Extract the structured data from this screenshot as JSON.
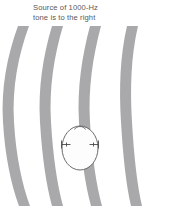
{
  "figure": {
    "caption_line1": "Source of 1000-Hz",
    "caption_line2": "tone is to the right",
    "caption": "Source of 1000-Hz\ntone is to the right",
    "caption_color": "#58585a",
    "background_color": "#ffffff"
  },
  "scene": {
    "sound_source_direction": "right",
    "tone_frequency": "1000-Hz",
    "view": "top-down head",
    "wavefronts": {
      "count": 4,
      "color": "#a9a9ab",
      "band_width": 10,
      "curvature": "concave toward the right",
      "top_x": [
        18,
        52,
        90,
        127
      ],
      "mid_x": [
        3,
        40,
        79,
        121
      ],
      "bottom_x": [
        19,
        52,
        91,
        128
      ]
    },
    "head": {
      "outline_color": "#5b5b5d",
      "fill_color": "#fdfdfd",
      "center_x": 80,
      "center_y": 122,
      "radius_x": 18,
      "radius_y": 22,
      "nose_label": "nose",
      "ears": 2,
      "ear_y": 118
    }
  }
}
